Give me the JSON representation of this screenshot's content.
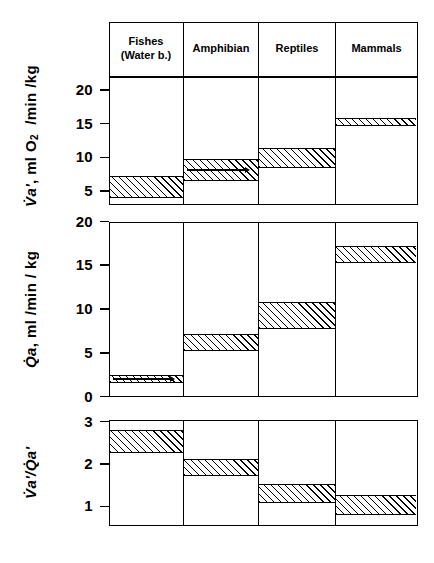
{
  "figure": {
    "groups": [
      {
        "id": "fishes",
        "label_line1": "Fishes",
        "label_line2": "(Water b.)"
      },
      {
        "id": "amphibian",
        "label_line1": "Amphibian",
        "label_line2": ""
      },
      {
        "id": "reptiles",
        "label_line1": "Reptiles",
        "label_line2": ""
      },
      {
        "id": "mammals",
        "label_line1": "Mammals",
        "label_line2": ""
      }
    ]
  },
  "panels": [
    {
      "id": "va",
      "ylabel_main": "Va'",
      "ylabel_rest": ", ml O",
      "ylabel_sub": "2",
      "ylabel_tail": "  /min /kg",
      "ylabel_full": "Va', ml O2 /min /kg",
      "ticks": [
        20,
        15,
        10,
        5
      ],
      "tick_labels": [
        "20",
        "15",
        "10",
        "5"
      ],
      "axis_min": 3.0,
      "axis_max": 22.0,
      "bands": [
        {
          "group": "fishes",
          "low": 4.0,
          "high": 7.3,
          "arrow": false
        },
        {
          "group": "amphibian",
          "low": 6.5,
          "high": 9.8,
          "arrow": true
        },
        {
          "group": "reptiles",
          "low": 8.4,
          "high": 11.4,
          "arrow": false
        },
        {
          "group": "mammals",
          "low": 14.6,
          "high": 15.8,
          "arrow": false
        }
      ]
    },
    {
      "id": "qa",
      "ylabel_main": "Qa",
      "ylabel_rest": ", ml /min / kg",
      "ylabel_sub": "",
      "ylabel_tail": "",
      "ylabel_full": "Qa, ml /min / kg",
      "ticks": [
        20,
        15,
        10,
        5,
        0
      ],
      "tick_labels": [
        "20",
        "15",
        "10",
        "5",
        "0"
      ],
      "axis_min": 0.0,
      "axis_max": 20.0,
      "bands": [
        {
          "group": "fishes",
          "low": 1.5,
          "high": 2.5,
          "arrow": true
        },
        {
          "group": "amphibian",
          "low": 5.2,
          "high": 7.1,
          "arrow": false
        },
        {
          "group": "reptiles",
          "low": 7.7,
          "high": 10.8,
          "arrow": false
        },
        {
          "group": "mammals",
          "low": 15.3,
          "high": 17.2,
          "arrow": false
        }
      ]
    },
    {
      "id": "ratio",
      "ylabel_main": "Va'/Qa'",
      "ylabel_rest": "",
      "ylabel_sub": "",
      "ylabel_tail": "",
      "ylabel_full": "Va'/Qa'",
      "ticks": [
        3,
        2,
        1
      ],
      "tick_labels": [
        "3",
        "2",
        "1"
      ],
      "axis_min": 0.55,
      "axis_max": 3.05,
      "bands": [
        {
          "group": "fishes",
          "low": 2.26,
          "high": 2.8,
          "arrow": false
        },
        {
          "group": "amphibian",
          "low": 1.72,
          "high": 2.12,
          "arrow": false
        },
        {
          "group": "reptiles",
          "low": 1.08,
          "high": 1.52,
          "arrow": false
        },
        {
          "group": "mammals",
          "low": 0.8,
          "high": 1.26,
          "arrow": false
        }
      ]
    }
  ],
  "chart_data": {
    "type": "bar",
    "subtitle": "",
    "xlabel": "",
    "grid": false,
    "legend": "none",
    "categories": [
      "Fishes (Water b.)",
      "Amphibian",
      "Reptiles",
      "Mammals"
    ],
    "panels": [
      {
        "ylabel": "Va', ml O2 /min /kg",
        "ylim": [
          3,
          22
        ],
        "yticks": [
          5,
          10,
          15,
          20
        ],
        "ranges_low": [
          4.0,
          6.5,
          8.4,
          14.6
        ],
        "ranges_high": [
          7.3,
          9.8,
          11.4,
          15.8
        ],
        "annotations": [
          "arrow marker inside Amphibian band"
        ]
      },
      {
        "ylabel": "Qa, ml /min / kg",
        "ylim": [
          0,
          20
        ],
        "yticks": [
          0,
          5,
          10,
          15,
          20
        ],
        "ranges_low": [
          1.5,
          5.2,
          7.7,
          15.3
        ],
        "ranges_high": [
          2.5,
          7.1,
          10.8,
          17.2
        ],
        "annotations": [
          "arrow marker inside Fishes band"
        ]
      },
      {
        "ylabel": "Va'/Qa'",
        "ylim": [
          0.55,
          3.05
        ],
        "yticks": [
          1,
          2,
          3
        ],
        "ranges_low": [
          2.26,
          1.72,
          1.08,
          0.8
        ],
        "ranges_high": [
          2.8,
          2.12,
          1.52,
          1.26
        ],
        "annotations": []
      }
    ]
  }
}
